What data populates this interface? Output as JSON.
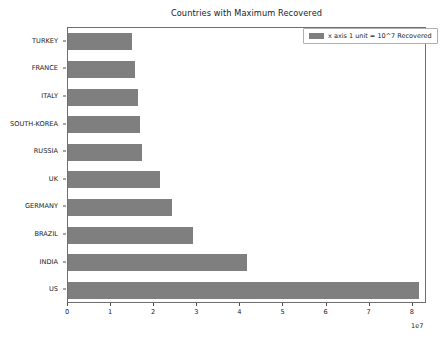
{
  "chart_data": {
    "type": "bar",
    "orientation": "horizontal",
    "title": "Countries with Maximum Recovered",
    "xlabel": "",
    "ylabel": "",
    "categories": [
      "US",
      "INDIA",
      "BRAZIL",
      "GERMANY",
      "UK",
      "RUSSIA",
      "SOUTH-KOREA",
      "ITALY",
      "FRANCE",
      "TURKEY"
    ],
    "values": [
      81500000,
      41500000,
      29000000,
      24200000,
      21400000,
      17200000,
      16700000,
      16200000,
      15600000,
      14800000
    ],
    "series": [
      {
        "name": "x axis 1 unit = 10^7 Recovered",
        "values": [
          81500000,
          41500000,
          29000000,
          24200000,
          21400000,
          17200000,
          16700000,
          16200000,
          15600000,
          14800000
        ]
      }
    ],
    "xlim": [
      0,
      83300000
    ],
    "ylim": [
      -0.5,
      9.5
    ],
    "xticks": [
      0,
      10000000,
      20000000,
      30000000,
      40000000,
      50000000,
      60000000,
      70000000,
      80000000
    ],
    "xtick_labels": [
      "0",
      "1",
      "2",
      "3",
      "4",
      "5",
      "6",
      "7",
      "8"
    ],
    "x_offset_label": "1e7",
    "grid": false,
    "legend_position": "upper right",
    "legend_entries": [
      "x axis 1 unit = 10^7 Recovered"
    ],
    "bar_color": "#7f7f7f"
  },
  "legend": {
    "label": "x axis 1 unit = 10^7 Recovered"
  },
  "axis": {
    "offset_text": "1e7"
  }
}
